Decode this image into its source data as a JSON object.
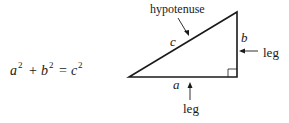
{
  "equation": {
    "a": "a",
    "b": "b",
    "c": "c",
    "exp": "2",
    "plus": "+",
    "equals": "="
  },
  "triangle": {
    "side_a": "a",
    "side_b": "b",
    "side_c": "c",
    "hypotenuse_label": "hypotenuse",
    "leg_right_label": "leg",
    "leg_bottom_label": "leg"
  }
}
